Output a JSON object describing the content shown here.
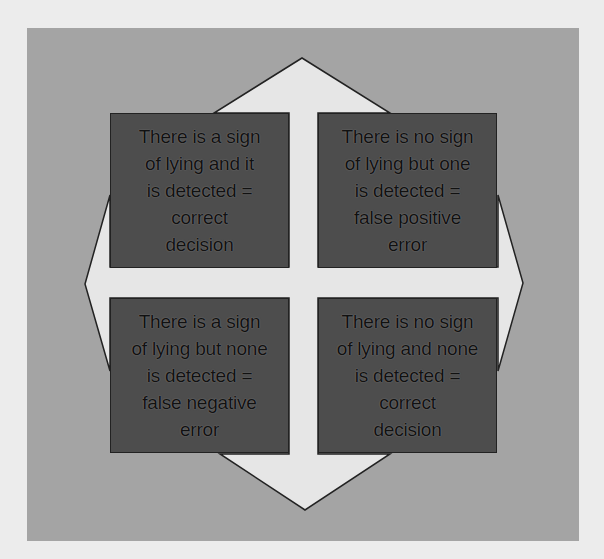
{
  "diagram": {
    "type": "four-quadrant decision matrix with four-way arrow",
    "colors": {
      "page_background": "#ececec",
      "panel_background": "#a4a4a4",
      "arrow_fill": "#e6e6e6",
      "arrow_outline": "#222222",
      "box_fill": "#4d4d4d",
      "box_text": "#111111"
    },
    "quadrants": [
      {
        "position": "top-left",
        "text": "There is a sign\nof lying and it\nis detected =\ncorrect\ndecision"
      },
      {
        "position": "top-right",
        "text": "There is no sign\nof lying but one\nis detected =\nfalse positive\nerror"
      },
      {
        "position": "bottom-left",
        "text": "There is a sign\nof lying but none\nis detected =\nfalse negative\nerror"
      },
      {
        "position": "bottom-right",
        "text": "There is no sign\nof lying and none\nis detected =\ncorrect\ndecision"
      }
    ],
    "arrow": {
      "directions": [
        "up",
        "down",
        "left",
        "right"
      ]
    }
  }
}
